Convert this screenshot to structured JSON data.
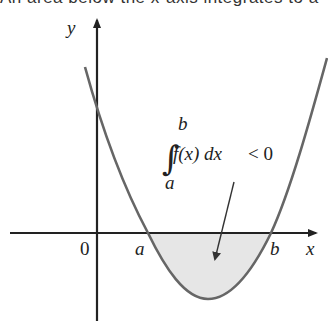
{
  "caption": "An area below the x-axis integrates to a",
  "axes": {
    "x_label": "x",
    "y_label": "y",
    "origin_label": "0"
  },
  "points": {
    "a_label": "a",
    "b_label": "b"
  },
  "annotation": {
    "integral_sign": "∫",
    "upper_limit": "b",
    "lower_limit": "a",
    "integrand": "f(x) dx",
    "relation": "< 0"
  },
  "colors": {
    "axis": "#222222",
    "curve": "#666666",
    "shaded_region": "#e6e6e6",
    "text": "#222222"
  }
}
